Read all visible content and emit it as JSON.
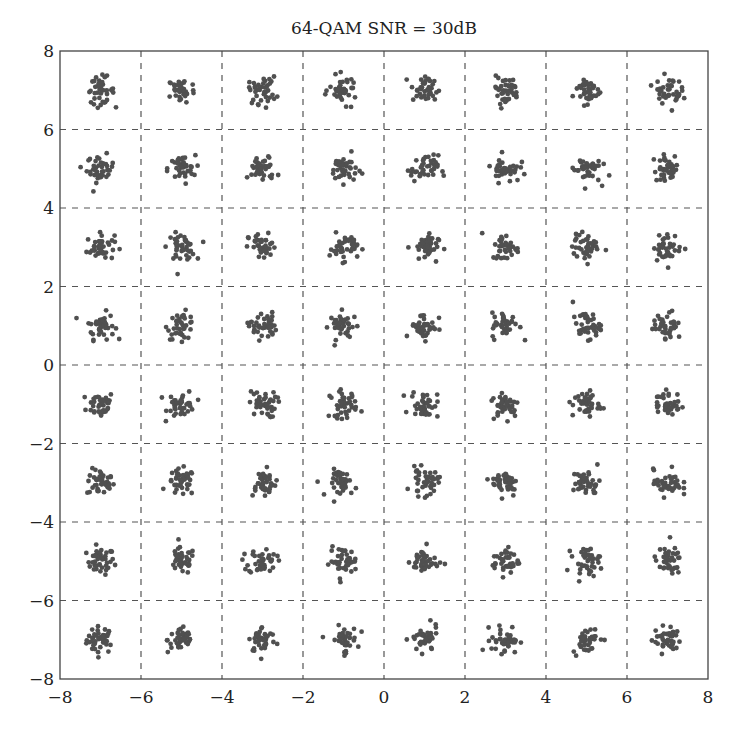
{
  "chart_data": {
    "type": "scatter",
    "title": "64-QAM  SNR = 30dB",
    "xlabel": "",
    "ylabel": "",
    "xlim": [
      -8,
      8
    ],
    "ylim": [
      -8,
      8
    ],
    "xticks": [
      -8,
      -6,
      -4,
      -2,
      0,
      2,
      4,
      6,
      8
    ],
    "yticks": [
      -8,
      -6,
      -4,
      -2,
      0,
      2,
      4,
      6,
      8
    ],
    "xtick_labels": [
      "−8",
      "−6",
      "−4",
      "−2",
      "0",
      "2",
      "4",
      "6",
      "8"
    ],
    "ytick_labels": [
      "−8",
      "−6",
      "−4",
      "−2",
      "0",
      "2",
      "4",
      "6",
      "8"
    ],
    "grid": true,
    "grid_style": "dashed",
    "legend": null,
    "constellation": {
      "levels_i": [
        -7,
        -5,
        -3,
        -1,
        1,
        3,
        5,
        7
      ],
      "levels_q": [
        -7,
        -5,
        -3,
        -1,
        1,
        3,
        5,
        7
      ],
      "points_per_symbol": 40,
      "noise_std": 0.17
    },
    "series": [
      {
        "name": "received symbols",
        "color": "#505050",
        "marker_radius": 2.4
      }
    ]
  }
}
